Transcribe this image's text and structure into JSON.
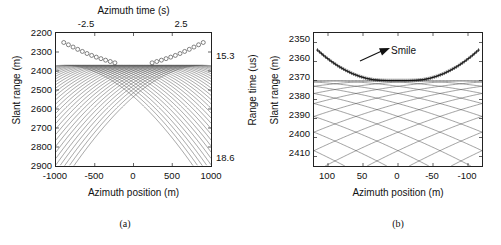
{
  "figure": {
    "panels": [
      {
        "id": "a",
        "caption": "(a)",
        "axes": {
          "x_bottom": {
            "label": "Azimuth position (m)",
            "ticks": [
              "-1000",
              "-500",
              "0",
              "500",
              "1000"
            ],
            "values": [
              -1000,
              -500,
              0,
              500,
              1000
            ],
            "range": [
              -1000,
              1000
            ]
          },
          "x_top": {
            "label": "Azimuth time (s)",
            "ticks": [
              "-2.5",
              "2.5"
            ],
            "values": [
              -2.5,
              2.5
            ],
            "range": [
              -5.0,
              5.0
            ]
          },
          "y_left": {
            "label": "Slant range (m)",
            "ticks": [
              "2200",
              "2300",
              "2400",
              "2500",
              "2600",
              "2700",
              "2800",
              "2900"
            ],
            "values": [
              2200,
              2300,
              2400,
              2500,
              2600,
              2700,
              2800,
              2900
            ],
            "range": [
              2200,
              2900
            ]
          },
          "y_right": {
            "label": "Range time (us)",
            "ticks": [
              "15.3",
              "18.6"
            ],
            "values": [
              15.3,
              18.6
            ],
            "range": [
              14.67,
              19.34
            ]
          }
        }
      },
      {
        "id": "b",
        "caption": "(b)",
        "annotation": "Smile",
        "axes": {
          "x_bottom": {
            "label": "Azimuth position (m)",
            "ticks": [
              "100",
              "50",
              "0",
              "-50",
              "-100"
            ],
            "values": [
              100,
              50,
              0,
              -50,
              -100
            ],
            "range": [
              120,
              -120
            ]
          },
          "y_left": {
            "label": "Slant range (m)",
            "ticks": [
              "2350",
              "2360",
              "2370",
              "2380",
              "2390",
              "2400",
              "2410"
            ],
            "values": [
              2350,
              2360,
              2370,
              2380,
              2390,
              2400,
              2410
            ],
            "range": [
              2345,
              2415
            ]
          }
        }
      }
    ]
  },
  "chart_data": [
    {
      "type": "line",
      "title": "",
      "panel": "a",
      "xlabel": "Azimuth position (m)",
      "ylabel": "Slant range (m)",
      "xlabel_secondary": "Azimuth time (s)",
      "ylabel_secondary": "Range time (us)",
      "xlim": [
        -1000,
        1000
      ],
      "ylim": [
        2900,
        2200
      ],
      "xlim_secondary": [
        -5.0,
        5.0
      ],
      "ylim_secondary": [
        19.34,
        14.67
      ],
      "grid": false,
      "legend": null,
      "description": "Family of range-migration hyperbolas for point targets distributed in azimuth; each curve has apex at its own closest-approach range. Circular markers trace the apex (minimum slant range) locus of each hyperbola.",
      "series_description": "Each curve is R(x) = sqrt(R0^2 + (x - x0)^2) with R0 the closest-approach slant range.",
      "closest_approach_range_m": 2370,
      "n_curves": 31,
      "target_azimuth_positions_m": [
        -900,
        -840,
        -780,
        -720,
        -660,
        -600,
        -540,
        -480,
        -420,
        -360,
        -300,
        -240,
        -180,
        -120,
        -60,
        0,
        60,
        120,
        180,
        240,
        300,
        360,
        420,
        480,
        540,
        600,
        660,
        720,
        780,
        840,
        900
      ],
      "apex_markers": {
        "marker": "circle",
        "x": [
          -900,
          -840,
          -780,
          -720,
          -660,
          -600,
          -540,
          -480,
          -420,
          -360,
          -300,
          -240,
          240,
          300,
          360,
          420,
          480,
          540,
          600,
          660,
          720,
          780,
          840,
          900
        ],
        "y": [
          2250,
          2262,
          2274,
          2286,
          2297,
          2308,
          2318,
          2327,
          2335,
          2343,
          2350,
          2357,
          2357,
          2350,
          2343,
          2335,
          2327,
          2318,
          2308,
          2297,
          2286,
          2274,
          2262,
          2250
        ]
      }
    },
    {
      "type": "line",
      "title": "",
      "panel": "b",
      "xlabel": "Azimuth position (m)",
      "ylabel": "Slant range (m)",
      "xlim": [
        120,
        -120
      ],
      "ylim": [
        2415,
        2345
      ],
      "grid": false,
      "legend": null,
      "annotations": [
        {
          "text": "Smile",
          "x": -30,
          "y": 2356
        }
      ],
      "description": "Zoomed view of the apex region of panel (a). The locus of hyperbola apexes forms an upward-curving 'smile' marked by dense cross/plus markers.",
      "closest_approach_range_m": 2370,
      "n_curves": 31,
      "smile_curve": {
        "marker": "plus",
        "x": [
          115,
          105,
          95,
          85,
          75,
          65,
          55,
          45,
          35,
          25,
          15,
          5,
          -5,
          -15,
          -25,
          -35,
          -45,
          -55,
          -65,
          -75,
          -85,
          -95,
          -105,
          -115
        ],
        "y": [
          2354.0,
          2357.2,
          2360.0,
          2362.5,
          2364.6,
          2366.4,
          2367.8,
          2368.9,
          2369.6,
          2369.9,
          2370.0,
          2370.0,
          2370.0,
          2370.0,
          2369.9,
          2369.6,
          2368.9,
          2367.8,
          2366.4,
          2364.6,
          2362.5,
          2360.0,
          2357.2,
          2354.0
        ]
      }
    }
  ]
}
